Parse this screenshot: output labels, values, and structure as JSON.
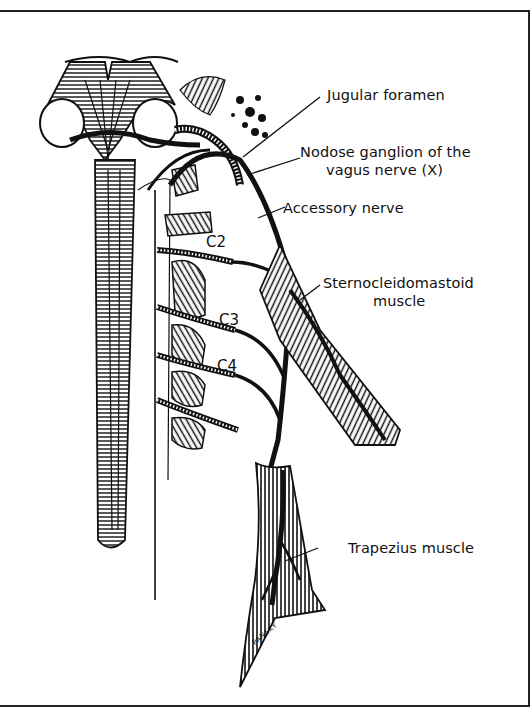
{
  "figure": {
    "labels": {
      "jugular_foramen": "Jugular foramen",
      "nodose_ganglion_line1": "Nodose ganglion of the",
      "nodose_ganglion_line2": "vagus nerve (X)",
      "accessory_nerve": "Accessory nerve",
      "sternocleidomastoid_line1": "Sternocleidomastoid",
      "sternocleidomastoid_line2": "muscle",
      "trapezius": "Trapezius muscle"
    },
    "spinal_levels": [
      "C2",
      "C3",
      "C4"
    ],
    "signature": "PANSKY"
  },
  "colors": {
    "ink": "#111111",
    "background": "#ffffff"
  }
}
